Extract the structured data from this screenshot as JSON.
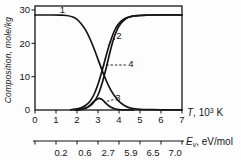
{
  "figure": {
    "y_axis_label": "Composition, mole/kg",
    "x_axis_label": {
      "sym": "T",
      "mid": ", 10",
      "sup": "3",
      "suffix": " K"
    },
    "secondary_axis_label": {
      "sym": "E",
      "sub": "v",
      "suffix": ", eV/mol"
    }
  },
  "chart_data": {
    "type": "line",
    "title": "",
    "xlabel": "T, 10^3 K",
    "ylabel": "Composition, mole/kg",
    "secondary_xlabel": "E_v, eV/mol",
    "xlim": [
      0,
      7
    ],
    "ylim": [
      0,
      31.2
    ],
    "grid": false,
    "legend": "none",
    "line_color": "#151515",
    "x_ticks": [
      0,
      1,
      2,
      3,
      4,
      5,
      6,
      7
    ],
    "y_ticks": [
      0,
      10,
      20,
      30
    ],
    "secondary_x_tick_positions": [
      0,
      1,
      2,
      3,
      4,
      5,
      6,
      7
    ],
    "secondary_x_labels": [
      {
        "text": "0.2",
        "at": 1.24
      },
      {
        "text": "0.6",
        "at": 2.38
      },
      {
        "text": "2.7",
        "at": 3.48
      },
      {
        "text": "5.9",
        "at": 4.57
      },
      {
        "text": "6.5",
        "at": 5.62
      },
      {
        "text": "7.0",
        "at": 6.67
      }
    ],
    "series": [
      {
        "name": "1",
        "points": [
          [
            0,
            28.5
          ],
          [
            0.8,
            28.5
          ],
          [
            1.2,
            28.45
          ],
          [
            1.5,
            28.35
          ],
          [
            1.8,
            27.9
          ],
          [
            2.0,
            27.2
          ],
          [
            2.2,
            25.9
          ],
          [
            2.4,
            24.1
          ],
          [
            2.6,
            21.6
          ],
          [
            2.8,
            18.6
          ],
          [
            3.0,
            15.2
          ],
          [
            3.2,
            11.8
          ],
          [
            3.4,
            8.7
          ],
          [
            3.6,
            6.1
          ],
          [
            3.8,
            4.1
          ],
          [
            4.0,
            2.6
          ],
          [
            4.3,
            1.2
          ],
          [
            4.6,
            0.5
          ],
          [
            5.0,
            0.2
          ],
          [
            5.5,
            0.1
          ],
          [
            6.0,
            0.05
          ],
          [
            7,
            0.05
          ]
        ]
      },
      {
        "name": "2",
        "points": [
          [
            1.7,
            0.05
          ],
          [
            2.0,
            0.35
          ],
          [
            2.2,
            0.7
          ],
          [
            2.4,
            1.35
          ],
          [
            2.6,
            2.5
          ],
          [
            2.8,
            4.5
          ],
          [
            3.0,
            7.7
          ],
          [
            3.2,
            11.9
          ],
          [
            3.4,
            16.6
          ],
          [
            3.6,
            20.8
          ],
          [
            3.8,
            24.0
          ],
          [
            4.0,
            26.0
          ],
          [
            4.3,
            27.5
          ],
          [
            4.6,
            28.1
          ],
          [
            5.0,
            28.35
          ],
          [
            5.5,
            28.5
          ],
          [
            7,
            28.5
          ]
        ]
      },
      {
        "name": "4",
        "points": [
          [
            2.1,
            0.05
          ],
          [
            2.4,
            0.55
          ],
          [
            2.6,
            1.15
          ],
          [
            2.8,
            2.35
          ],
          [
            3.0,
            4.5
          ],
          [
            3.2,
            8.1
          ],
          [
            3.4,
            12.9
          ],
          [
            3.6,
            18.1
          ],
          [
            3.8,
            22.4
          ],
          [
            4.0,
            25.2
          ],
          [
            4.3,
            27.3
          ],
          [
            4.6,
            28.1
          ],
          [
            5.0,
            28.35
          ],
          [
            5.5,
            28.5
          ],
          [
            7,
            28.5
          ]
        ]
      },
      {
        "name": "3",
        "points": [
          [
            1.9,
            0.02
          ],
          [
            2.2,
            0.2
          ],
          [
            2.5,
            0.8
          ],
          [
            2.8,
            2.6
          ],
          [
            3.0,
            3.4
          ],
          [
            3.05,
            3.5
          ],
          [
            3.2,
            3.1
          ],
          [
            3.4,
            1.9
          ],
          [
            3.6,
            0.9
          ],
          [
            3.8,
            0.38
          ],
          [
            4.0,
            0.12
          ],
          [
            4.3,
            0.03
          ],
          [
            4.7,
            0
          ]
        ]
      }
    ],
    "curve_labels": [
      {
        "text": "1",
        "x": 1.31,
        "y": 30.0,
        "leader": null
      },
      {
        "text": "2",
        "x": 4.0,
        "y": 22.2,
        "leader": {
          "x1": 3.81,
          "y1": 21.3,
          "x2": 3.46,
          "y2": 19.6
        }
      },
      {
        "text": "4",
        "x": 4.57,
        "y": 13.8,
        "leader": {
          "x1": 4.33,
          "y1": 13.5,
          "x2": 3.28,
          "y2": 13.5
        }
      },
      {
        "text": "3",
        "x": 3.95,
        "y": 3.6,
        "leader": {
          "x1": 3.74,
          "y1": 3.1,
          "x2": 3.41,
          "y2": 2.6
        }
      }
    ]
  }
}
